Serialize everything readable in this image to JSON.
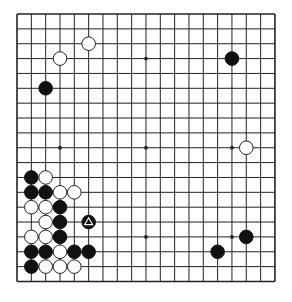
{
  "board": {
    "size": 19,
    "origin_x": 17,
    "origin_y": 14,
    "cell_w": 14.33,
    "cell_h": 14.86,
    "stone_radius": 6.8,
    "line_color": "#222222",
    "black_color": "#111111",
    "white_fill": "#ffffff",
    "white_stroke": "#222222",
    "star_points": [
      [
        3,
        9
      ],
      [
        9,
        3
      ],
      [
        9,
        9
      ],
      [
        15,
        9
      ],
      [
        9,
        15
      ],
      [
        15,
        15
      ],
      [
        3,
        3
      ],
      [
        3,
        15
      ],
      [
        15,
        3
      ]
    ],
    "stones": [
      {
        "color": "white",
        "col": 5,
        "row": 2
      },
      {
        "color": "white",
        "col": 3,
        "row": 3
      },
      {
        "color": "black",
        "col": 2,
        "row": 5
      },
      {
        "color": "black",
        "col": 15,
        "row": 3
      },
      {
        "color": "white",
        "col": 16,
        "row": 9
      },
      {
        "color": "black",
        "col": 16,
        "row": 15
      },
      {
        "color": "black",
        "col": 14,
        "row": 16
      },
      {
        "color": "black",
        "col": 1,
        "row": 11
      },
      {
        "color": "white",
        "col": 2,
        "row": 11
      },
      {
        "color": "black",
        "col": 1,
        "row": 12
      },
      {
        "color": "black",
        "col": 2,
        "row": 12
      },
      {
        "color": "white",
        "col": 3,
        "row": 12
      },
      {
        "color": "white",
        "col": 4,
        "row": 12
      },
      {
        "color": "white",
        "col": 1,
        "row": 13
      },
      {
        "color": "white",
        "col": 2,
        "row": 13
      },
      {
        "color": "black",
        "col": 3,
        "row": 13
      },
      {
        "color": "white",
        "col": 2,
        "row": 14
      },
      {
        "color": "black",
        "col": 3,
        "row": 14
      },
      {
        "color": "black",
        "col": 5,
        "row": 14,
        "marker": "triangle"
      },
      {
        "color": "white",
        "col": 1,
        "row": 15
      },
      {
        "color": "white",
        "col": 2,
        "row": 15
      },
      {
        "color": "black",
        "col": 3,
        "row": 15
      },
      {
        "color": "black",
        "col": 1,
        "row": 16
      },
      {
        "color": "black",
        "col": 2,
        "row": 16
      },
      {
        "color": "white",
        "col": 3,
        "row": 16
      },
      {
        "color": "black",
        "col": 4,
        "row": 16
      },
      {
        "color": "black",
        "col": 5,
        "row": 16
      },
      {
        "color": "black",
        "col": 1,
        "row": 17
      },
      {
        "color": "white",
        "col": 2,
        "row": 17
      },
      {
        "color": "white",
        "col": 3,
        "row": 17
      },
      {
        "color": "white",
        "col": 4,
        "row": 17
      }
    ]
  }
}
